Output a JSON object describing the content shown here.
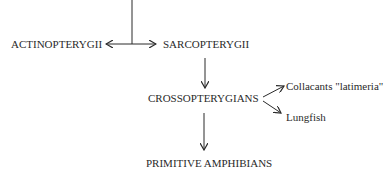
{
  "diagram": {
    "nodes": {
      "actinopterygii": "ACTINOPTERYGII",
      "sarcopterygii": "SARCOPTERYGII",
      "crossopterygians": "CROSSOPTERYGIANS",
      "collacants": "Collacants \"latimeria\"",
      "lungfish": "Lungfish",
      "primitive_amphibians": "PRIMITIVE AMPHIBIANS"
    },
    "edges": [
      {
        "from": "root",
        "to": "actinopterygii"
      },
      {
        "from": "root",
        "to": "sarcopterygii"
      },
      {
        "from": "sarcopterygii",
        "to": "crossopterygians"
      },
      {
        "from": "crossopterygians",
        "to": "collacants"
      },
      {
        "from": "crossopterygians",
        "to": "lungfish"
      },
      {
        "from": "crossopterygians",
        "to": "primitive_amphibians"
      }
    ],
    "line_color": "#2a2a2a"
  }
}
